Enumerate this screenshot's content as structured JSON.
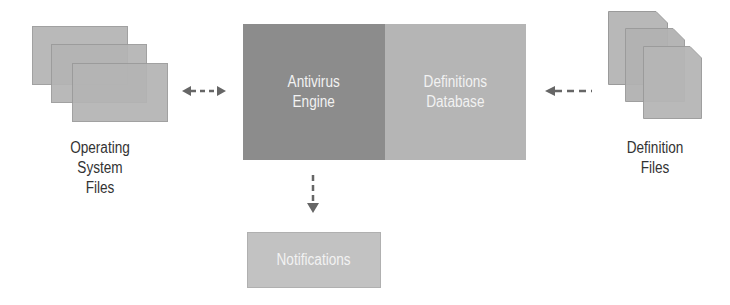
{
  "diagram": {
    "nodes": {
      "os_files": {
        "label_lines": [
          "Operating",
          "System",
          "Files"
        ]
      },
      "antivirus_engine": {
        "label_lines": [
          "Antivirus",
          "Engine"
        ]
      },
      "definitions_database": {
        "label_lines": [
          "Definitions",
          "Database"
        ]
      },
      "definition_files": {
        "label_lines": [
          "Definition",
          "Files"
        ]
      },
      "notifications": {
        "label": "Notifications"
      }
    },
    "edges": [
      {
        "from": "os_files",
        "to": "antivirus_engine",
        "style": "dashed",
        "direction": "bidirectional"
      },
      {
        "from": "definition_files",
        "to": "definitions_database",
        "style": "dashed",
        "direction": "forward"
      },
      {
        "from": "antivirus_engine",
        "to": "notifications",
        "style": "dashed",
        "direction": "forward"
      }
    ],
    "colors": {
      "engine_fill": "#8c8c8c",
      "database_fill": "#b5b5b5",
      "file_fill": "#b4b4b4",
      "notification_fill": "#c2c2c2",
      "arrow": "#666666",
      "label_text": "#333333",
      "box_text": "#f2f2f2"
    }
  }
}
